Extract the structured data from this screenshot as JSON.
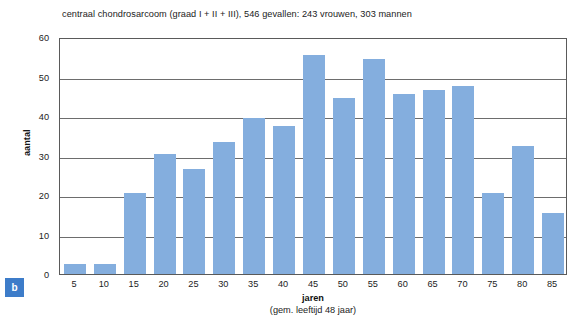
{
  "chart_data": {
    "type": "bar",
    "title": "centraal chondrosarcoom (graad I + II + III), 546 gevallen: 243 vrouwen, 303 mannen",
    "xlabel": "jaren",
    "xlabel_sub": "(gem. leeftijd 48 jaar)",
    "ylabel": "aantal",
    "categories": [
      "5",
      "10",
      "15",
      "20",
      "25",
      "30",
      "35",
      "40",
      "45",
      "50",
      "55",
      "60",
      "65",
      "70",
      "75",
      "80",
      "85"
    ],
    "values": [
      2.5,
      2.5,
      20.5,
      30.5,
      26.5,
      33.5,
      39.5,
      37.5,
      55.5,
      44.5,
      54.5,
      45.5,
      46.5,
      47.5,
      20.5,
      32.5,
      15.5
    ],
    "ylim": [
      0,
      60
    ],
    "yticks": [
      0,
      10,
      20,
      30,
      40,
      50,
      60
    ],
    "grid": true,
    "legend": false,
    "bar_color": "#84aede",
    "axis_color": "#5a5a5a",
    "gridline_color": "#6d6d6d"
  },
  "panel": {
    "badge_label": "b",
    "badge_color": "#3d7cc9"
  }
}
